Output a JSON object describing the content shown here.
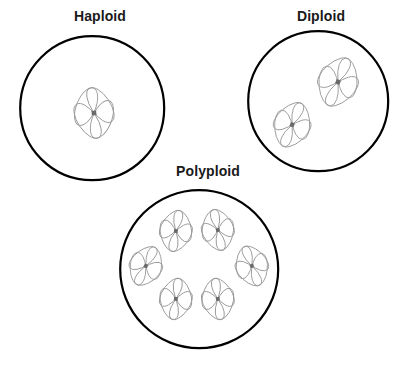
{
  "diagram": {
    "title_visible": false,
    "background_color": "#ffffff",
    "membrane_color": "#000000",
    "membrane_stroke_width": 2.2,
    "chromosome_color": "#9a9a9a",
    "chromosome_stroke_width": 0.9,
    "centromere_color": "#6a6a6a",
    "label_color": "#1a1a1a"
  },
  "cells": [
    {
      "id": "haploid",
      "label": "Haploid",
      "label_x": 57,
      "label_y": 8,
      "label_width": 86,
      "circle": {
        "cx": 92,
        "cy": 108,
        "r": 72
      },
      "chromosome_count": 1,
      "chromosomes": [
        {
          "x": 94,
          "y": 113,
          "scale": 1.0,
          "rotation": -6
        }
      ]
    },
    {
      "id": "diploid",
      "label": "Diploid",
      "label_x": 281,
      "label_y": 8,
      "label_width": 80,
      "circle": {
        "cx": 318,
        "cy": 101,
        "r": 70
      },
      "chromosome_count": 2,
      "chromosomes": [
        {
          "x": 338,
          "y": 82,
          "scale": 1.0,
          "rotation": 22
        },
        {
          "x": 292,
          "y": 125,
          "scale": 0.92,
          "rotation": 22
        }
      ]
    },
    {
      "id": "polyploid",
      "label": "Polyploid",
      "label_x": 158,
      "label_y": 163,
      "label_width": 100,
      "circle": {
        "cx": 199,
        "cy": 269,
        "r": 79
      },
      "chromosome_count": 6,
      "chromosomes": [
        {
          "x": 176,
          "y": 231,
          "scale": 0.82,
          "rotation": 10
        },
        {
          "x": 218,
          "y": 230,
          "scale": 0.82,
          "rotation": -12
        },
        {
          "x": 146,
          "y": 266,
          "scale": 0.82,
          "rotation": 26
        },
        {
          "x": 252,
          "y": 266,
          "scale": 0.82,
          "rotation": -20
        },
        {
          "x": 176,
          "y": 299,
          "scale": 0.82,
          "rotation": 8
        },
        {
          "x": 218,
          "y": 299,
          "scale": 0.82,
          "rotation": -8
        }
      ]
    }
  ],
  "legend": {
    "chromosome_icon_name": "chromosome-icon",
    "cell_icon_name": "cell-membrane-icon"
  }
}
